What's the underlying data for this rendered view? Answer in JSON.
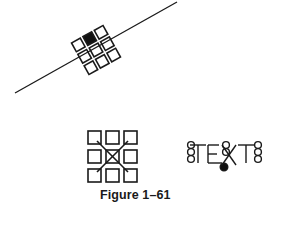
{
  "figure": {
    "caption": "Figure 1–61",
    "colors": {
      "stroke": "#1a1a1a",
      "background": "#ffffff",
      "fill_selected": "#111111"
    }
  },
  "panels": [
    {
      "name": "rotated-grid-on-line",
      "description": "3x3 grid of squares rotated along a diagonal line; top-middle square filled black",
      "filled_square": "top-middle"
    },
    {
      "name": "grid-with-x",
      "description": "3x3 grid of squares with an X crossing through the center square"
    },
    {
      "name": "text-with-grips",
      "text": "TEXT",
      "description": "Text object with circular grips stacked at left and right ends and a filled grip near the middle"
    }
  ]
}
